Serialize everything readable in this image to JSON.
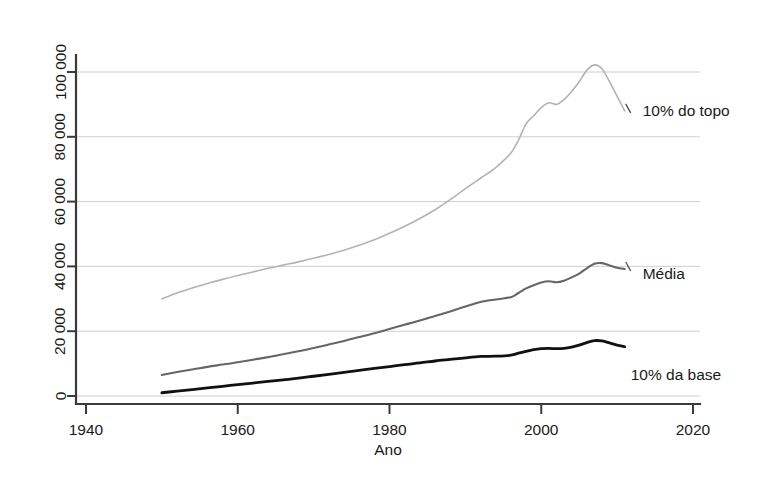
{
  "chart_data": {
    "type": "line",
    "title": "",
    "subtitle": "",
    "xlabel": "Ano",
    "ylabel": "",
    "xlim": [
      1940,
      2020
    ],
    "ylim": [
      0,
      108000
    ],
    "grid": true,
    "legend_position": "inline-right-of-series-end",
    "x_ticks": [
      "1940",
      "1960",
      "1980",
      "2000",
      "2020"
    ],
    "x_tick_values": [
      1940,
      1960,
      1980,
      2000,
      2020
    ],
    "y_ticks": [
      "0",
      "20 000",
      "40 000",
      "60 000",
      "80 000",
      "100 000"
    ],
    "y_tick_values": [
      0,
      20000,
      40000,
      60000,
      80000,
      100000
    ],
    "x": [
      1950,
      1952,
      1954,
      1956,
      1958,
      1960,
      1962,
      1964,
      1966,
      1968,
      1970,
      1972,
      1974,
      1976,
      1978,
      1980,
      1982,
      1984,
      1986,
      1988,
      1990,
      1992,
      1994,
      1996,
      1997,
      1998,
      1999,
      2000,
      2001,
      2002,
      2003,
      2004,
      2005,
      2006,
      2007,
      2008,
      2009,
      2010,
      2011
    ],
    "series": [
      {
        "name": "10% do topo",
        "color": "#b3b3b3",
        "width": 1.6,
        "values": [
          30000,
          31800,
          33300,
          34700,
          36000,
          37200,
          38300,
          39400,
          40400,
          41400,
          42500,
          43700,
          45000,
          46500,
          48200,
          50200,
          52400,
          54800,
          57500,
          60600,
          64000,
          67200,
          70500,
          75000,
          79000,
          84000,
          86500,
          89000,
          90500,
          90000,
          91500,
          94000,
          97000,
          100500,
          102200,
          101000,
          97000,
          92500,
          88000
        ]
      },
      {
        "name": "Média",
        "color": "#666666",
        "width": 2.1,
        "values": [
          6500,
          7400,
          8200,
          9000,
          9700,
          10400,
          11200,
          12000,
          12900,
          13800,
          14800,
          15900,
          17000,
          18200,
          19400,
          20700,
          22000,
          23300,
          24700,
          26100,
          27600,
          29000,
          29800,
          30500,
          31800,
          33200,
          34200,
          35000,
          35400,
          35100,
          35600,
          36600,
          37800,
          39400,
          40800,
          41000,
          40300,
          39600,
          39200
        ]
      },
      {
        "name": "10% da base",
        "color": "#111111",
        "width": 2.8,
        "values": [
          1000,
          1500,
          2000,
          2500,
          3000,
          3500,
          4000,
          4500,
          5000,
          5500,
          6100,
          6700,
          7300,
          7900,
          8500,
          9100,
          9700,
          10200,
          10800,
          11300,
          11800,
          12200,
          12300,
          12600,
          13200,
          13800,
          14300,
          14600,
          14700,
          14600,
          14700,
          15100,
          15700,
          16500,
          17100,
          17000,
          16400,
          15700,
          15200
        ]
      }
    ],
    "annotations": [
      {
        "text": "10% do topo",
        "series": "10% do topo"
      },
      {
        "text": "Média",
        "series": "Média"
      },
      {
        "text": "10% da base",
        "series": "10% da base"
      }
    ]
  },
  "axis": {
    "x_title": "Ano",
    "y_title": ""
  },
  "colors": {
    "background": "#ffffff",
    "grid": "#cfcfcf",
    "axis": "#3a3a3a",
    "top_decile": "#b3b3b3",
    "average": "#666666",
    "bottom_decile": "#111111"
  }
}
